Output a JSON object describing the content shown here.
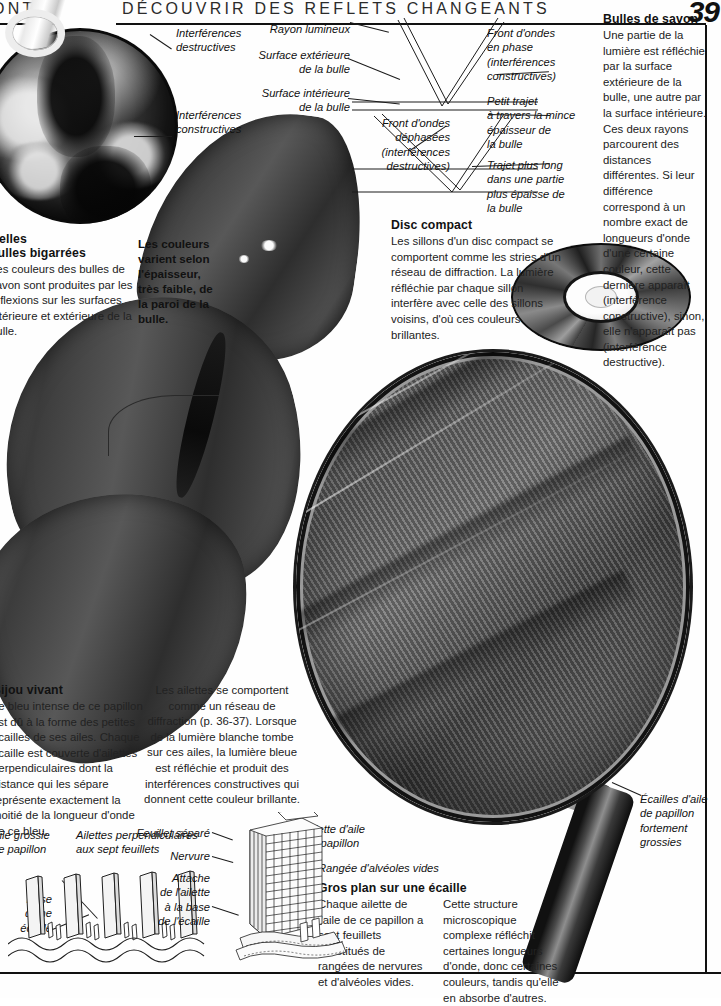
{
  "header": {
    "left_text": "ONT",
    "title": "DÉCOUVRIR DES REFLETS CHANGEANTS",
    "page_number": "39"
  },
  "panels": {
    "bulles_de_savon": {
      "heading": "Bulles de savon",
      "body": "Une partie de la lumière est réfléchie par la surface extérieure de la bulle, une autre par la surface intérieure. Ces deux rayons parcourent des distances différentes. Si leur différence correspond à un nombre exact de longueurs d'onde d'une certaine couleur, cette dernière apparaît (interférence constructive), sinon, elle n'apparaît pas (interférence destructive)."
    },
    "disc_compact": {
      "heading": "Disc compact",
      "body": "Les sillons d'un disc compact se comportent comme les stries d'un réseau de diffraction. La lumière réfléchie par chaque sillon interfère avec celle des sillons voisins, d'où ces couleurs brillantes."
    },
    "belles_bulles": {
      "heading_line1": "Belles",
      "heading_line2": "bulles bigarrées",
      "body": "Les couleurs des bulles de savon sont produites par les réflexions sur les surfaces intérieure et extérieure de la bulle."
    },
    "epaisseur": {
      "body": "Les couleurs varient selon l'épaisseur, très faible, de la paroi de la bulle."
    },
    "bijou_vivant": {
      "heading": "Bijou vivant",
      "body": "Le bleu intense de ce papillon est dû à la forme des petites écailles de ses ailes. Chaque écaille est couverte d'ailettes perpendiculaires dont la distance qui les sépare représente exactement la moitié de la longueur d'onde de ce bleu."
    },
    "ailettes_reseau": {
      "body": "Les ailettes se comportent comme un réseau de diffraction (p. 36-37). Lorsque de la lumière blanche tombe sur ces ailes, la lumière bleue est réfléchie et produit des interférences constructives qui donnent cette couleur brillante."
    },
    "gros_plan": {
      "heading": "Gros plan sur une écaille",
      "column1": "Chaque ailette de l'aile de ce papillon a sept feuillets constitués de rangées de nervures et d'alvéoles vides.",
      "column2": "Cette structure microscopique complexe réfléchit certaines longueurs d'onde, donc certaines couleurs, tandis qu'elle en absorbe d'autres."
    }
  },
  "callouts": {
    "interferences_destructives": "Interférences\ndestructives",
    "interferences_constructives": "Interférences\nconstructives",
    "rayon_lumineux": "Rayon lumineux",
    "surface_exterieure": "Surface extérieure\nde la bulle",
    "surface_interieure": "Surface intérieure\nde la bulle",
    "front_ondes_phase": "Front d'ondes\nen phase\n(interférences\nconstructives)",
    "front_ondes_dephasees": "Front d'ondes\ndéphasées\n(interférences\ndestructives)",
    "petit_trajet": "Petit trajet\nà travers la mince\népaisseur de\nla bulle",
    "trajet_plus_long": "Trajet plus long\ndans une partie\nplus épaisse de\nla bulle",
    "ecailles_aile": "Écailles d'aile\nde papillon\nfortement\ngrossies",
    "aile_grossie": "Aile grossie\nde papillon",
    "base_ecaille": "Base\nd'une\nécaille",
    "ailettes_sept_feuillets": "Ailettes perpendiculaires\naux sept feuillets",
    "feuillet_separe": "Feuillet séparé",
    "nervure": "Nervure",
    "attache_ailette": "Attache\nde l'ailette\nà la base\nde l'écaille",
    "ailette_aile": "Ailette d'aile\nde papillon",
    "rangee_alveoles": "Rangée d'alvéoles vides"
  },
  "images": {
    "soap_bubble": "soap-bubble-photo",
    "compact_disc": "compact-disc-photo",
    "butterfly": "blue-morpho-butterfly-photo",
    "magnifier": "magnifying-glass-over-wing-photo"
  },
  "colors": {
    "ink": "#1a1a1a",
    "rule": "#111111",
    "paper": "#fefefe"
  }
}
